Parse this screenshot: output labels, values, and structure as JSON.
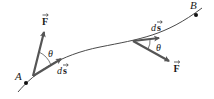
{
  "diagram": {
    "colors": {
      "path": "#4a4a4a",
      "vector": "#555555",
      "point": "#111111",
      "text": "#1a1a1a",
      "background": "#ffffff"
    },
    "points": [
      {
        "id": "A",
        "label": "A",
        "x": 26,
        "y": 83
      },
      {
        "id": "B",
        "label": "B",
        "x": 196,
        "y": 15
      }
    ],
    "vectors": [
      {
        "id": "F-at-A",
        "label": "F",
        "from": [
          33,
          76
        ],
        "to": [
          44,
          32
        ]
      },
      {
        "id": "ds-at-A",
        "label": "ds",
        "from": [
          33,
          76
        ],
        "to": [
          61,
          59
        ]
      },
      {
        "id": "ds-at-right",
        "label": "ds",
        "from": [
          133,
          41
        ],
        "to": [
          159,
          38
        ]
      },
      {
        "id": "F-at-right",
        "label": "F",
        "from": [
          133,
          41
        ],
        "to": [
          169,
          61
        ]
      }
    ],
    "angles": [
      {
        "id": "theta-left",
        "label": "θ"
      },
      {
        "id": "theta-right",
        "label": "θ"
      }
    ],
    "labels": {
      "point_a": "A",
      "point_b": "B",
      "force_left": "F",
      "force_right": "F",
      "ds_left_d": "d",
      "ds_left_s": "s",
      "ds_right_d": "d",
      "ds_right_s": "s",
      "theta_left": "θ",
      "theta_right": "θ"
    }
  }
}
